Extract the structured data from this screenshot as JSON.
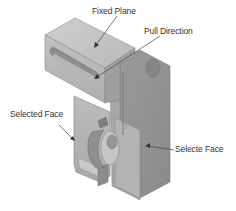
{
  "figure": {
    "colors": {
      "background": "#ffffff",
      "face_light": "#c8c8c8",
      "face_mid": "#adadad",
      "face_dark": "#8f8f8f",
      "face_darker": "#7a7a7a",
      "edge": "#6a6a6a",
      "leader": "#444444",
      "text": "#333333"
    }
  },
  "callouts": {
    "fixed_plane": "Fixed Plane",
    "pull_direction": "Pull Direction",
    "selected_face_left": "Selected Face",
    "selected_face_right": "Selecte Face"
  }
}
